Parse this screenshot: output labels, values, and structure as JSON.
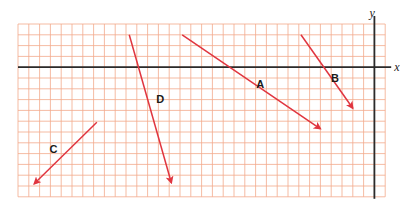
{
  "diagram": {
    "title": "",
    "axes": {
      "x_label": "x",
      "y_label": "y"
    },
    "grid": {
      "columns": 34,
      "rows": 16,
      "color": "#f2a98c",
      "origin_col": 33,
      "origin_row": 4
    },
    "colors": {
      "vector": "#e0353f",
      "axis": "#2b2b2b",
      "label": "#1a1a1a"
    },
    "vectors": [
      {
        "label": "A",
        "from": [
          -17.8,
          3.0
        ],
        "to": [
          -5.0,
          -5.7
        ]
      },
      {
        "label": "B",
        "from": [
          -6.8,
          3.0
        ],
        "to": [
          -2.0,
          -3.8
        ]
      },
      {
        "label": "C",
        "from": [
          -25.7,
          -5.1
        ],
        "to": [
          -31.5,
          -10.8
        ]
      },
      {
        "label": "D",
        "from": [
          -22.7,
          3.0
        ],
        "to": [
          -18.8,
          -10.7
        ]
      }
    ]
  }
}
